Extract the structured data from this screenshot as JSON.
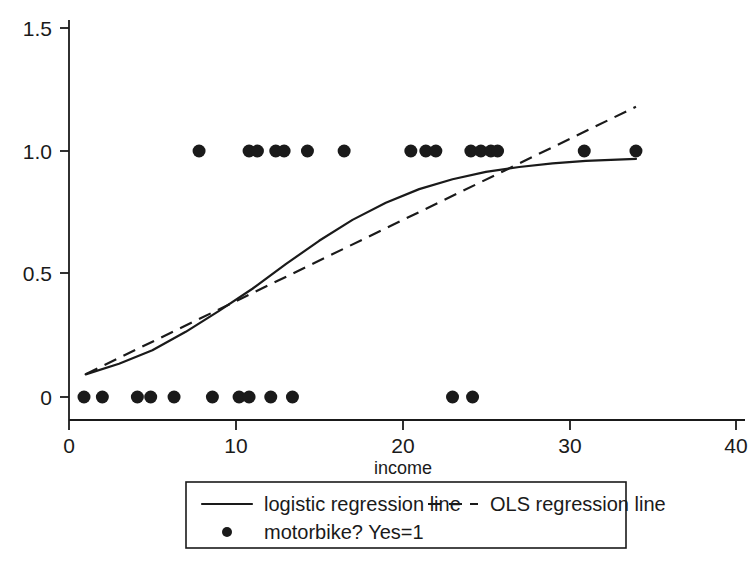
{
  "chart_data": {
    "type": "scatter",
    "title": "",
    "subtitle": "",
    "xlabel": "income",
    "ylabel": "",
    "xlim": [
      0,
      40
    ],
    "ylim": [
      0,
      1.5
    ],
    "grid": false,
    "legend_position": "bottom",
    "x_ticks": [
      {
        "value": 0,
        "label": "0"
      },
      {
        "value": 10,
        "label": "10"
      },
      {
        "value": 20,
        "label": "20"
      },
      {
        "value": 30,
        "label": "30"
      },
      {
        "value": 40,
        "label": "40"
      }
    ],
    "y_ticks": [
      {
        "value": 0,
        "label": "0"
      },
      {
        "value": 0.5,
        "label": "0.5"
      },
      {
        "value": 1.0,
        "label": "1.0"
      },
      {
        "value": 1.5,
        "label": "1.5"
      }
    ],
    "series": [
      {
        "name": "motorbike? Yes=1",
        "type": "scatter",
        "marker": "filled-circle",
        "points": [
          {
            "x": 0.9,
            "y": 0
          },
          {
            "x": 2.0,
            "y": 0
          },
          {
            "x": 4.1,
            "y": 0
          },
          {
            "x": 4.9,
            "y": 0
          },
          {
            "x": 6.3,
            "y": 0
          },
          {
            "x": 8.6,
            "y": 0
          },
          {
            "x": 10.2,
            "y": 0
          },
          {
            "x": 10.8,
            "y": 0
          },
          {
            "x": 12.1,
            "y": 0
          },
          {
            "x": 13.4,
            "y": 0
          },
          {
            "x": 23.0,
            "y": 0
          },
          {
            "x": 24.2,
            "y": 0
          },
          {
            "x": 7.8,
            "y": 1
          },
          {
            "x": 10.8,
            "y": 1
          },
          {
            "x": 11.3,
            "y": 1
          },
          {
            "x": 12.4,
            "y": 1
          },
          {
            "x": 12.9,
            "y": 1
          },
          {
            "x": 14.3,
            "y": 1
          },
          {
            "x": 16.5,
            "y": 1
          },
          {
            "x": 20.5,
            "y": 1
          },
          {
            "x": 21.4,
            "y": 1
          },
          {
            "x": 22.0,
            "y": 1
          },
          {
            "x": 24.1,
            "y": 1
          },
          {
            "x": 24.7,
            "y": 1
          },
          {
            "x": 25.3,
            "y": 1
          },
          {
            "x": 25.7,
            "y": 1
          },
          {
            "x": 30.9,
            "y": 1
          },
          {
            "x": 34.0,
            "y": 1
          }
        ]
      },
      {
        "name": "logistic regression line",
        "type": "line",
        "style": "solid",
        "points": [
          {
            "x": 1.0,
            "y": 0.092
          },
          {
            "x": 3.0,
            "y": 0.135
          },
          {
            "x": 5.0,
            "y": 0.19
          },
          {
            "x": 7.0,
            "y": 0.265
          },
          {
            "x": 9.0,
            "y": 0.35
          },
          {
            "x": 11.0,
            "y": 0.44
          },
          {
            "x": 13.0,
            "y": 0.54
          },
          {
            "x": 15.0,
            "y": 0.635
          },
          {
            "x": 17.0,
            "y": 0.72
          },
          {
            "x": 19.0,
            "y": 0.79
          },
          {
            "x": 21.0,
            "y": 0.845
          },
          {
            "x": 23.0,
            "y": 0.885
          },
          {
            "x": 25.0,
            "y": 0.915
          },
          {
            "x": 27.0,
            "y": 0.935
          },
          {
            "x": 29.0,
            "y": 0.95
          },
          {
            "x": 31.0,
            "y": 0.96
          },
          {
            "x": 34.0,
            "y": 0.968
          }
        ]
      },
      {
        "name": "OLS regression line",
        "type": "line",
        "style": "dashed",
        "points": [
          {
            "x": 1.0,
            "y": 0.093
          },
          {
            "x": 34.0,
            "y": 1.18
          }
        ]
      }
    ],
    "legend_entries": [
      {
        "label": "logistic regression line",
        "marker": "solid-line"
      },
      {
        "label": "OLS regression line",
        "marker": "dashed-line"
      },
      {
        "label": "motorbike? Yes=1",
        "marker": "filled-circle"
      }
    ]
  }
}
